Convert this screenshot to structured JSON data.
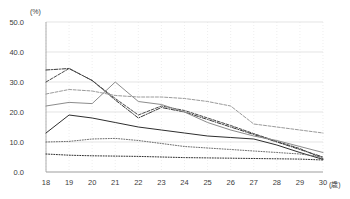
{
  "chart_data": {
    "type": "line",
    "title": "",
    "subtitle": "",
    "xlabel": "(歳)",
    "ylabel": "(%)",
    "x": [
      18,
      19,
      20,
      21,
      22,
      23,
      24,
      25,
      26,
      27,
      28,
      29,
      30
    ],
    "xtick_labels": [
      "18",
      "19",
      "20",
      "21",
      "22",
      "23",
      "24",
      "25",
      "26",
      "27",
      "28",
      "29",
      "30"
    ],
    "ytick_labels": [
      "0.0",
      "10.0",
      "20.0",
      "30.0",
      "40.0",
      "50.0"
    ],
    "ytick_values": [
      0,
      10,
      20,
      30,
      40,
      50
    ],
    "xlim": [
      18,
      30
    ],
    "ylim": [
      0,
      50
    ],
    "grid": true,
    "grid_axis": "y",
    "legend": "none",
    "series": [
      {
        "name": "series-1-dashdot-dark",
        "style": "dash-dot",
        "color": "#3a3a3a",
        "values": [
          34.0,
          34.5,
          30.5,
          24.0,
          18.0,
          21.5,
          20.0,
          17.5,
          15.0,
          12.5,
          10.0,
          7.5,
          5.0
        ]
      },
      {
        "name": "series-2-dashed-dark",
        "style": "dashed",
        "color": "#4a4a4a",
        "values": [
          30.0,
          34.5,
          30.5,
          24.5,
          19.0,
          22.0,
          20.5,
          18.0,
          15.5,
          12.8,
          10.2,
          7.8,
          4.5
        ]
      },
      {
        "name": "series-3-solid-gray",
        "style": "solid",
        "color": "#8c8c8c",
        "values": [
          22.0,
          23.2,
          22.8,
          30.0,
          23.5,
          22.5,
          20.0,
          16.5,
          14.0,
          12.0,
          10.5,
          8.5,
          6.5
        ]
      },
      {
        "name": "series-4-dashed-gray",
        "style": "dashed",
        "color": "#9a9a9a",
        "values": [
          26.0,
          27.5,
          27.0,
          25.5,
          25.0,
          25.0,
          24.5,
          23.5,
          22.0,
          16.0,
          15.0,
          14.0,
          13.0
        ]
      },
      {
        "name": "series-5-solid-dark",
        "style": "solid",
        "color": "#2e2e2e",
        "values": [
          13.0,
          19.0,
          18.0,
          16.5,
          15.0,
          14.0,
          13.0,
          12.0,
          11.5,
          11.0,
          9.0,
          6.5,
          4.2
        ]
      },
      {
        "name": "series-6-dotted-mid",
        "style": "dotted",
        "color": "#6e6e6e",
        "values": [
          10.0,
          10.2,
          11.0,
          11.2,
          10.5,
          9.5,
          8.5,
          8.0,
          7.5,
          7.0,
          6.5,
          6.0,
          5.0
        ]
      },
      {
        "name": "series-7-dotted-low",
        "style": "dotted",
        "color": "#2e2e2e",
        "values": [
          6.0,
          5.6,
          5.4,
          5.3,
          5.2,
          5.0,
          4.8,
          4.7,
          4.6,
          4.5,
          4.4,
          4.3,
          4.0
        ]
      }
    ]
  },
  "axes": {
    "y_unit_label": "(%)",
    "x_unit_label": "(歳)"
  }
}
